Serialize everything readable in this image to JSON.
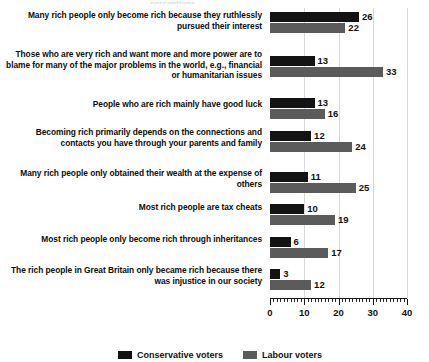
{
  "top_sliver_text": "perceptions",
  "chart_data": {
    "type": "bar",
    "orientation": "horizontal",
    "title": "",
    "subtitle": "",
    "xlabel": "",
    "ylabel": "",
    "xlim": [
      0,
      40
    ],
    "xticks": [
      0,
      10,
      20,
      30,
      40
    ],
    "xtick_labels": [
      "0",
      "10",
      "20",
      "30",
      "40"
    ],
    "minor_tick_step": 1,
    "grid": "vertical-only",
    "legend_position": "bottom",
    "categories": [
      "Many rich people only become rich because they ruthlessly pursued their interest",
      "Those who are very rich and want more and more power are to blame for many of the major problems in the world, e.g., financial or humanitarian issues",
      "People who are rich mainly have good luck",
      "Becoming rich primarily depends on the connections and contacts you have through your parents and family",
      "Many rich people only obtained their wealth at the expense of others",
      "Most rich people are tax cheats",
      "Most rich people only become rich through inheritances",
      "The rich people in Great Britain only became rich because there was injustice in our society"
    ],
    "series": [
      {
        "name": "Conservative voters",
        "color": "#131313",
        "values": [
          26,
          13,
          13,
          12,
          11,
          10,
          6,
          3
        ]
      },
      {
        "name": "Labour voters",
        "color": "#5b5b5b",
        "values": [
          22,
          33,
          16,
          24,
          25,
          19,
          17,
          12
        ]
      }
    ]
  },
  "legend": {
    "items": [
      {
        "label": "Conservative voters",
        "color": "#131313"
      },
      {
        "label": "Labour voters",
        "color": "#5b5b5b"
      }
    ]
  }
}
